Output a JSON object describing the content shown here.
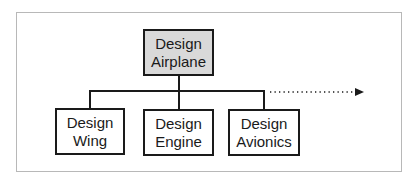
{
  "diagram": {
    "type": "hierarchy",
    "root": {
      "line1": "Design",
      "line2": "Airplane",
      "fill": "#d9d9d9"
    },
    "children": [
      {
        "line1": "Design",
        "line2": "Wing"
      },
      {
        "line1": "Design",
        "line2": "Engine"
      },
      {
        "line1": "Design",
        "line2": "Avionics"
      }
    ],
    "continuation": {
      "style": "dotted-arrow",
      "direction": "right"
    },
    "colors": {
      "stroke": "#1a1a1a",
      "frame": "#b8b8b8",
      "root_fill": "#d9d9d9",
      "child_fill": "#ffffff"
    }
  }
}
